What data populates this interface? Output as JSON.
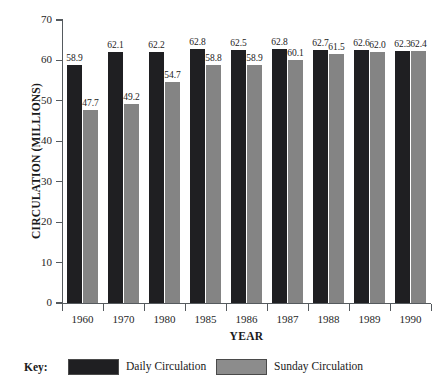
{
  "chart_data": {
    "type": "bar",
    "title": "",
    "xlabel": "YEAR",
    "ylabel": "CIRCULATION (MILLIONS)",
    "ylim": [
      0,
      70
    ],
    "yticks": [
      0,
      10,
      20,
      30,
      40,
      50,
      60,
      70
    ],
    "ytick_labels": [
      "0",
      "10",
      "20",
      "30",
      "40",
      "50",
      "60",
      "70"
    ],
    "grid": false,
    "legend_position": "bottom",
    "legend_prefix": "Key:",
    "categories": [
      "1960",
      "1970",
      "1980",
      "1985",
      "1986",
      "1987",
      "1988",
      "1989",
      "1990"
    ],
    "series": [
      {
        "name": "Daily Circulation",
        "color": "#1f1f22",
        "values": [
          58.9,
          62.1,
          62.2,
          62.8,
          62.5,
          62.8,
          62.7,
          62.6,
          62.3
        ],
        "labels": [
          "58.9",
          "62.1",
          "62.2",
          "62.8",
          "62.5",
          "62.8",
          "62.7",
          "62.6",
          "62.3"
        ]
      },
      {
        "name": "Sunday Circulation",
        "color": "#848484",
        "values": [
          47.7,
          49.2,
          54.7,
          58.8,
          58.9,
          60.1,
          61.5,
          62.0,
          62.4
        ],
        "labels": [
          "47.7",
          "49.2",
          "54.7",
          "58.8",
          "58.9",
          "60.1",
          "61.5",
          "62.0",
          "62.4"
        ]
      }
    ]
  }
}
